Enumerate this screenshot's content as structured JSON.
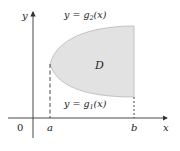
{
  "diagram": {
    "type": "type I region between two curves",
    "region": {
      "label": "D",
      "fill": "#e2e2e2",
      "stroke": "#b0b0b0"
    },
    "axes": {
      "x_label": "x",
      "y_label": "y",
      "origin_label": "0",
      "color": "#333333"
    },
    "bounds": {
      "left_label": "a",
      "right_label": "b"
    },
    "curves": {
      "upper": {
        "eq_prefix": "y = ",
        "func": "g",
        "sub": "2",
        "arg": "(x)"
      },
      "lower": {
        "eq_prefix": "y = ",
        "func": "g",
        "sub": "1",
        "arg": "(x)"
      }
    }
  }
}
